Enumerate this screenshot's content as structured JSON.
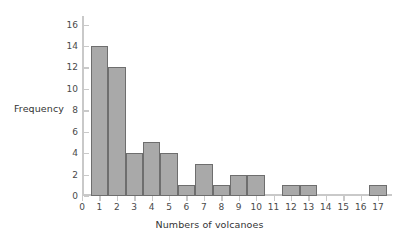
{
  "chart_data": {
    "type": "bar",
    "title": "",
    "xlabel": "Numbers of volcanoes",
    "ylabel": "Frequency",
    "categories": [
      1,
      2,
      3,
      4,
      5,
      6,
      7,
      8,
      9,
      10,
      11,
      12,
      13,
      14,
      15,
      16,
      17
    ],
    "values": [
      14,
      12,
      4,
      5,
      4,
      1,
      3,
      1,
      2,
      2,
      0,
      1,
      1,
      0,
      0,
      0,
      1
    ],
    "xlim": [
      0,
      17.8
    ],
    "ylim": [
      0,
      16.8
    ],
    "xticks": [
      0,
      1,
      2,
      3,
      4,
      5,
      6,
      7,
      8,
      9,
      10,
      11,
      12,
      13,
      14,
      15,
      16,
      17
    ],
    "yticks": [
      0,
      2,
      4,
      6,
      8,
      10,
      12,
      14,
      16
    ],
    "grid": false,
    "legend": false,
    "bar_fill_color": "#a9a9a9",
    "bar_edge_color": "#6e6e6e",
    "axis_color": "#c9c9c9",
    "background_color": "#ffffff",
    "bar_width": 1.0
  }
}
